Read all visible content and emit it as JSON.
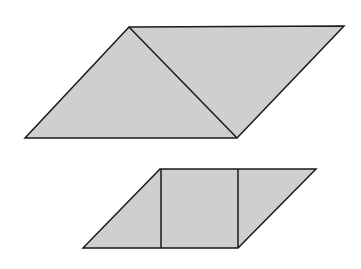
{
  "diagram": {
    "colors": {
      "fill": "#cfcfcf",
      "stroke": "#1a1a1a",
      "background": "#ffffff"
    },
    "shapes": [
      {
        "name": "top-parallelogram",
        "points": [
          [
            25,
            138
          ],
          [
            129,
            27
          ],
          [
            344,
            26
          ],
          [
            237,
            138
          ]
        ],
        "dividers": [
          {
            "name": "diagonal",
            "from": [
              129,
              27
            ],
            "to": [
              237,
              138
            ]
          }
        ]
      },
      {
        "name": "bottom-parallelogram",
        "points": [
          [
            83,
            248
          ],
          [
            160,
            169
          ],
          [
            316,
            169
          ],
          [
            238,
            248
          ]
        ],
        "dividers": [
          {
            "name": "left-vertical",
            "from": [
              161,
              169
            ],
            "to": [
              161,
              248
            ]
          },
          {
            "name": "right-vertical",
            "from": [
              238,
              169
            ],
            "to": [
              238,
              248
            ]
          }
        ]
      }
    ]
  }
}
